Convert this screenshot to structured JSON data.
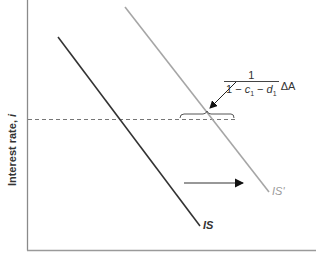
{
  "diagram": {
    "y_axis_label": "Interest rate, ",
    "y_axis_symbol": "i",
    "x_axis_label": "",
    "curves": [
      {
        "name": "IS",
        "label": "IS",
        "color": "#333333"
      },
      {
        "name": "IS'",
        "label": "IS'",
        "color": "#a6a6a6"
      }
    ],
    "annotation": {
      "numerator": "1",
      "denominator_prefix": "1 − ",
      "c": "c",
      "c_sub": "1",
      "minus": " − ",
      "d": "d",
      "d_sub": "1",
      "suffix": "ΔA"
    },
    "shift_arrow": "rightward shift",
    "colors": {
      "axis": "#888888",
      "is": "#333333",
      "is_prime": "#a6a6a6",
      "dashed": "#666666"
    }
  }
}
